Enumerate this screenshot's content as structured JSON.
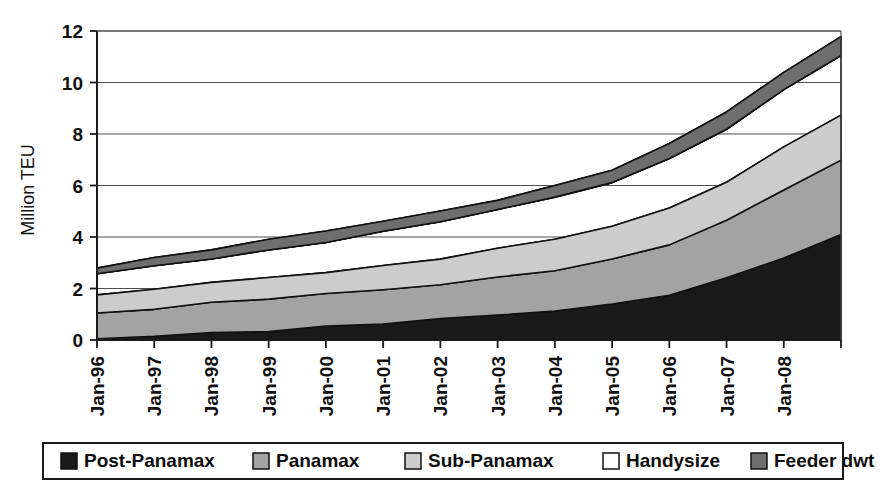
{
  "chart_data": {
    "type": "area",
    "stacked": true,
    "title": "",
    "subtitle": "",
    "xlabel": "",
    "ylabel": "Million TEU",
    "ylim": [
      0,
      12
    ],
    "ytick_values": [
      0,
      2,
      4,
      6,
      8,
      10,
      12
    ],
    "ytick_labels": [
      "0",
      "2",
      "4",
      "6",
      "8",
      "10",
      "12"
    ],
    "grid": true,
    "legend_position": "bottom",
    "x": [
      "Jan-96",
      "Jan-97",
      "Jan-98",
      "Jan-99",
      "Jan-00",
      "Jan-01",
      "Jan-02",
      "Jan-03",
      "Jan-04",
      "Jan-05",
      "Jan-06",
      "Jan-07",
      "Jan-08",
      "Jan-09"
    ],
    "categories": [
      "Jan-96",
      "Jan-97",
      "Jan-98",
      "Jan-99",
      "Jan-00",
      "Jan-01",
      "Jan-02",
      "Jan-03",
      "Jan-04",
      "Jan-05",
      "Jan-06",
      "Jan-07",
      "Jan-08",
      "Jan-09"
    ],
    "series": [
      {
        "name": "Post-Panamax",
        "color": "#1a1a1a",
        "values": [
          0.05,
          0.18,
          0.3,
          0.38,
          0.5,
          0.62,
          0.78,
          0.95,
          1.15,
          1.4,
          1.8,
          2.4,
          3.2,
          4.05
        ]
      },
      {
        "name": "Panamax",
        "color": "#a3a3a3",
        "values": [
          1.0,
          1.06,
          1.12,
          1.2,
          1.26,
          1.32,
          1.4,
          1.5,
          1.6,
          1.72,
          1.9,
          2.2,
          2.6,
          2.95
        ]
      },
      {
        "name": "Sub-Panamax",
        "color": "#cccccc",
        "values": [
          0.65,
          0.72,
          0.78,
          0.84,
          0.9,
          0.96,
          1.02,
          1.08,
          1.16,
          1.25,
          1.4,
          1.55,
          1.7,
          1.8
        ]
      },
      {
        "name": "Handysize",
        "color": "#ffffff",
        "values": [
          0.85,
          0.92,
          1.0,
          1.08,
          1.18,
          1.28,
          1.38,
          1.5,
          1.62,
          1.78,
          1.95,
          2.1,
          2.2,
          2.25
        ]
      },
      {
        "name": "Feeder dwt",
        "color": "#6e6e6e",
        "values": [
          0.3,
          0.32,
          0.34,
          0.36,
          0.38,
          0.4,
          0.42,
          0.44,
          0.47,
          0.5,
          0.55,
          0.6,
          0.65,
          0.7
        ]
      }
    ],
    "totals": [
      2.85,
      3.2,
      3.54,
      3.86,
      4.22,
      4.58,
      5.0,
      5.47,
      6.0,
      6.65,
      7.6,
      8.85,
      10.35,
      11.75
    ]
  },
  "legend": {
    "items": [
      {
        "label": "Post-Panamax",
        "color": "#1a1a1a"
      },
      {
        "label": "Panamax",
        "color": "#a3a3a3"
      },
      {
        "label": "Sub-Panamax",
        "color": "#cccccc"
      },
      {
        "label": "Handysize",
        "color": "#ffffff"
      },
      {
        "label": "Feeder dwt",
        "color": "#6e6e6e"
      }
    ]
  },
  "axes": {
    "y_title": "Million TEU"
  }
}
